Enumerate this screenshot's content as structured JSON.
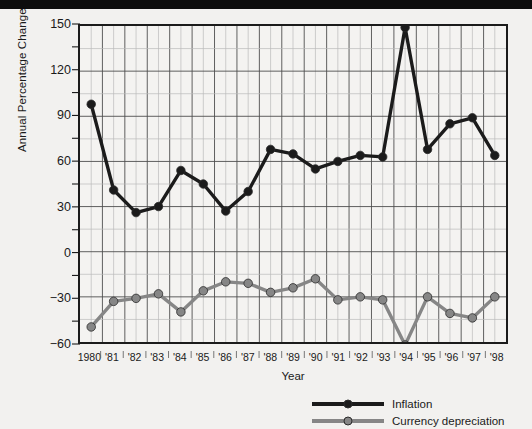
{
  "chart_data": {
    "type": "line",
    "title": "",
    "xlabel": "Year",
    "ylabel": "Annual Percentage Change",
    "x": [
      1980,
      1981,
      1982,
      1983,
      1984,
      1985,
      1986,
      1987,
      1988,
      1989,
      1990,
      1991,
      1992,
      1993,
      1994,
      1995,
      1996,
      1997,
      1998
    ],
    "categories": [
      "1980",
      "'81",
      "'82",
      "'83",
      "'84",
      "'85",
      "'86",
      "'87",
      "'88",
      "'89",
      "'90",
      "'91",
      "'92",
      "'93",
      "'94",
      "'95",
      "'96",
      "'97",
      "'98"
    ],
    "ylim": [
      -60,
      150
    ],
    "yticks": [
      150,
      120,
      90,
      60,
      30,
      0,
      -30,
      -60
    ],
    "ytick_labels": [
      "150",
      "120",
      "90",
      "60",
      "30",
      "0",
      "−30",
      "−60"
    ],
    "minor_y_step": 15,
    "grid": true,
    "legend_position": "below-right",
    "series": [
      {
        "name": "Inflation",
        "color": "#1b1b1b",
        "values": [
          98,
          41,
          26,
          30,
          54,
          45,
          27,
          40,
          68,
          65,
          55,
          60,
          64,
          63,
          149,
          68,
          85,
          89,
          64
        ]
      },
      {
        "name": "Currency depreciation",
        "color": "#868686",
        "values": [
          -50,
          -33,
          -31,
          -28,
          -40,
          -26,
          -20,
          -21,
          -27,
          -24,
          -18,
          -32,
          -30,
          -32,
          -62,
          -30,
          -41,
          -44,
          -30
        ]
      }
    ]
  },
  "legend": {
    "items": [
      {
        "label": "Inflation",
        "color": "#1b1b1b"
      },
      {
        "label": "Currency depreciation",
        "color": "#868686"
      }
    ]
  },
  "axes": {
    "y_title": "Annual Percentage Change",
    "x_title": "Year"
  }
}
